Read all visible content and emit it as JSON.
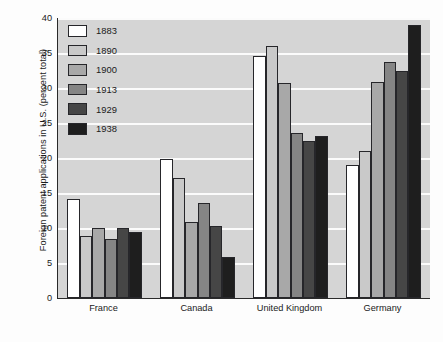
{
  "chart_data": {
    "type": "bar",
    "title": "",
    "xlabel": "",
    "ylabel": "Foreign patent applications in U.S. (percent total)",
    "ylim": [
      0,
      40
    ],
    "yticks": [
      0,
      5,
      10,
      15,
      20,
      25,
      30,
      35,
      40
    ],
    "grid": true,
    "legend_position": "top-left inside plot",
    "categories": [
      "France",
      "Canada",
      "United Kingdom",
      "Germany"
    ],
    "series": [
      {
        "name": "1883",
        "color": "#ffffff",
        "values": [
          14.2,
          19.9,
          34.6,
          19.0
        ]
      },
      {
        "name": "1890",
        "color": "#c9c9c9",
        "values": [
          8.8,
          17.1,
          36.0,
          21.0
        ]
      },
      {
        "name": "1900",
        "color": "#a8a8a8",
        "values": [
          10.0,
          10.9,
          30.7,
          30.8
        ]
      },
      {
        "name": "1913",
        "color": "#858585",
        "values": [
          8.5,
          13.6,
          23.6,
          33.7
        ]
      },
      {
        "name": "1929",
        "color": "#464646",
        "values": [
          10.0,
          10.3,
          22.5,
          32.5
        ]
      },
      {
        "name": "1938",
        "color": "#1e1e1e",
        "values": [
          9.5,
          5.9,
          23.2,
          39.0
        ]
      }
    ]
  }
}
